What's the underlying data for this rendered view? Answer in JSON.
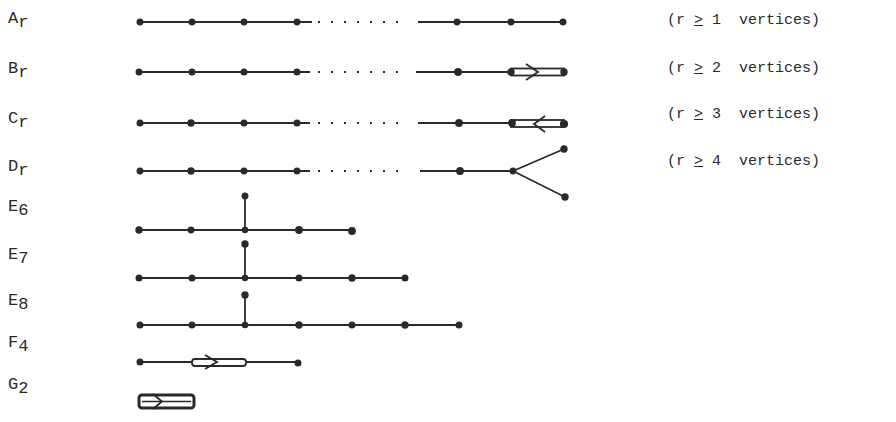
{
  "rows": [
    {
      "name": "A",
      "sub": "r",
      "y": 58,
      "condition": {
        "open": "(r ",
        "rel": ">",
        "close": " 1  vertices)"
      }
    },
    {
      "name": "B",
      "sub": "r",
      "y": 108,
      "condition": {
        "open": "(r ",
        "rel": ">",
        "close": " 2  vertices)"
      }
    },
    {
      "name": "C",
      "sub": "r",
      "y": 158,
      "condition": {
        "open": "(r ",
        "rel": ">",
        "close": " 3  vertices)"
      }
    },
    {
      "name": "D",
      "sub": "r",
      "y": 206,
      "condition": {
        "open": "(r ",
        "rel": ">",
        "close": " 4  vertices)"
      }
    },
    {
      "name": "E",
      "sub": "6",
      "y": 245
    },
    {
      "name": "E",
      "sub": "7",
      "y": 290
    },
    {
      "name": "E",
      "sub": "8",
      "y": 338
    },
    {
      "name": "F",
      "sub": "4",
      "y": 378
    },
    {
      "name": "G",
      "sub": "2",
      "y": 418
    }
  ]
}
